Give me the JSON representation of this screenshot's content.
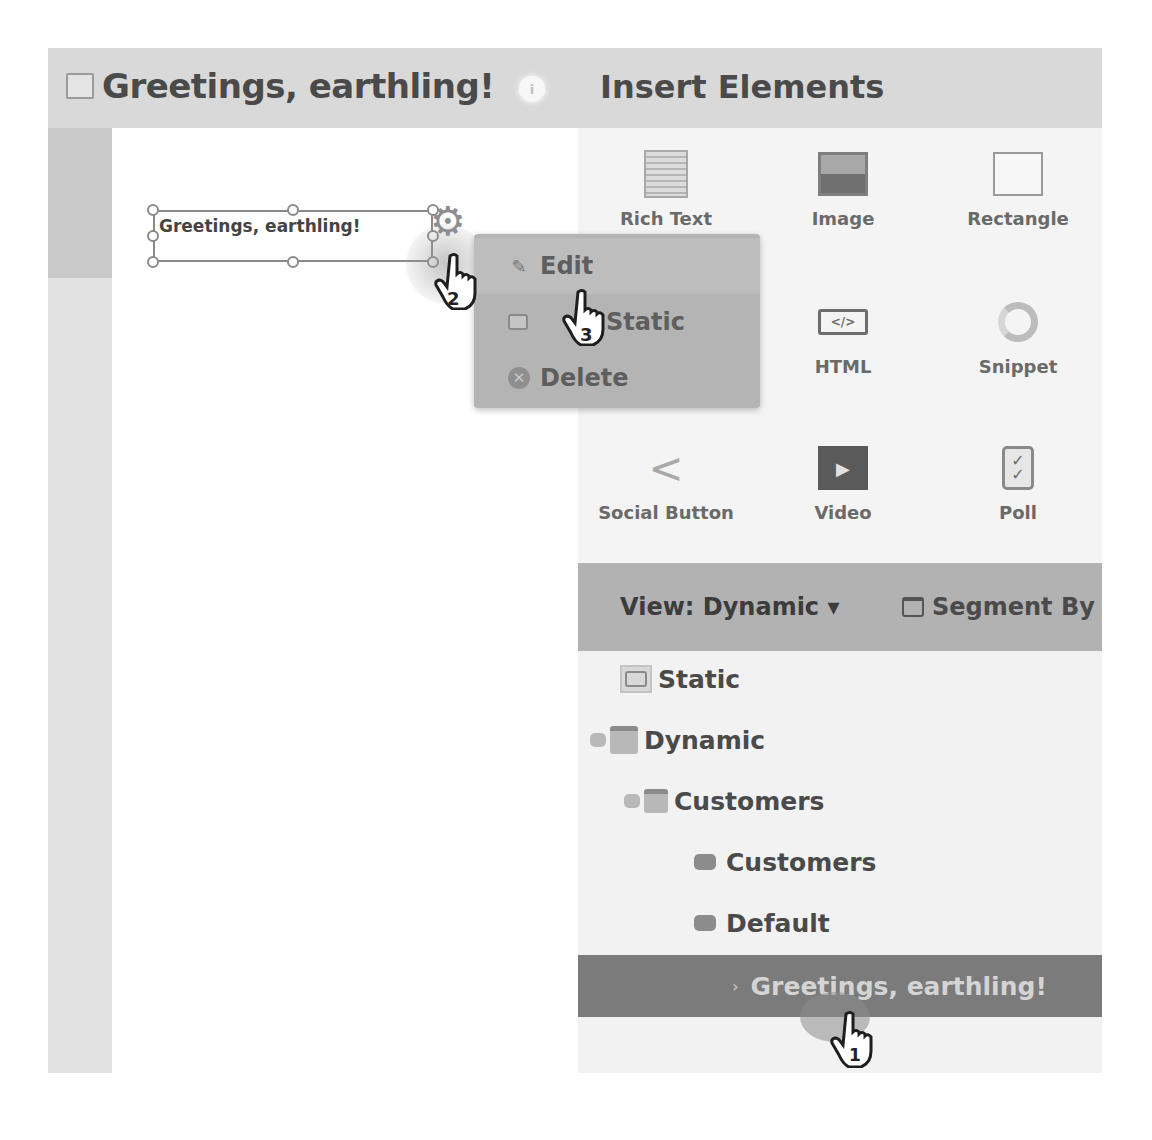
{
  "header": {
    "document_title": "Greetings, earthling!",
    "info_icon": "info-icon",
    "panel_title": "Insert Elements"
  },
  "canvas": {
    "selected_element_text": "Greetings, earthling!",
    "gear_icon": "gear-icon"
  },
  "context_menu": {
    "items": [
      {
        "label": "Edit",
        "icon": "pencil-icon"
      },
      {
        "label": "Make Static",
        "visible_label": "Static",
        "icon": "static-box-icon"
      },
      {
        "label": "Delete",
        "icon": "delete-circle-x-icon"
      }
    ]
  },
  "insert_elements": {
    "items": [
      {
        "label": "Rich Text",
        "icon": "rich-text-icon"
      },
      {
        "label": "Image",
        "icon": "image-icon"
      },
      {
        "label": "Rectangle",
        "icon": "rectangle-icon"
      },
      {
        "label": "HTML",
        "icon": "html-code-icon",
        "glyph": "</>"
      },
      {
        "label": "Snippet",
        "icon": "snippet-icon"
      },
      {
        "label": "Social Button",
        "icon": "share-icon"
      },
      {
        "label": "Video",
        "icon": "video-play-icon"
      },
      {
        "label": "Poll",
        "icon": "poll-clipboard-icon"
      }
    ]
  },
  "segment_panel": {
    "view_dropdown": "View: Dynamic ▾",
    "segment_by": "Segment By",
    "tree": [
      {
        "label": "Static",
        "level": 0,
        "type": "static"
      },
      {
        "label": "Dynamic",
        "level": 0,
        "type": "dynamic",
        "expanded": true
      },
      {
        "label": "Customers",
        "level": 1,
        "type": "segmentation",
        "expanded": true
      },
      {
        "label": "Customers",
        "level": 2,
        "type": "segment"
      },
      {
        "label": "Default",
        "level": 2,
        "type": "segment"
      },
      {
        "label": "Greetings, earthling!",
        "level": 3,
        "type": "element",
        "selected": true
      }
    ]
  },
  "step_markers": [
    {
      "number": "1",
      "target": "tree-item-greetings"
    },
    {
      "number": "2",
      "target": "gear-icon"
    },
    {
      "number": "3",
      "target": "menu-item-make-static"
    }
  ],
  "colors": {
    "header_bg": "#d9d9d9",
    "menu_bg": "#b4b4b4",
    "toolbar_bg": "#b2b2b2",
    "selected_row_bg": "#7b7b7b"
  }
}
